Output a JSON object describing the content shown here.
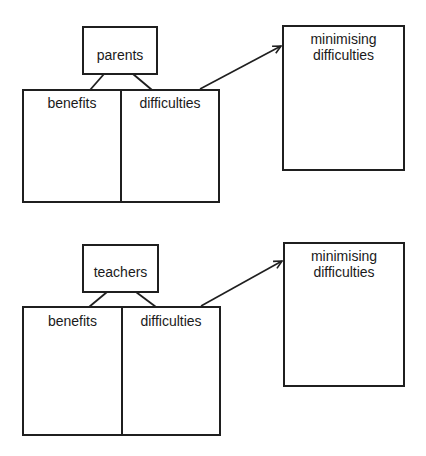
{
  "diagrams": [
    {
      "stakeholder": "parents",
      "columns": [
        "benefits",
        "difficulties"
      ],
      "target": [
        "minimising",
        "difficulties"
      ]
    },
    {
      "stakeholder": "teachers",
      "columns": [
        "benefits",
        "difficulties"
      ],
      "target": [
        "minimising",
        "difficulties"
      ]
    }
  ],
  "colors": {
    "line": "#1f1f1f",
    "background": "#ffffff"
  }
}
